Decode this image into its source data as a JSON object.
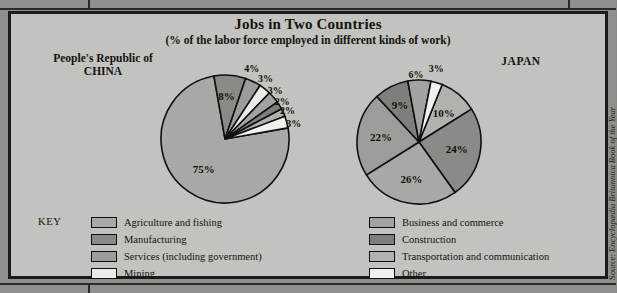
{
  "figure": {
    "title": "Jobs in Two Countries",
    "subtitle": "(% of the labor force employed in different kinds of work)",
    "source": "Source: Encyclopædia Britannica Book of the Year",
    "source_prefix": "Source: ",
    "source_italic": "Encyclopædia Britannica Book of the Year",
    "key_word": "KEY",
    "panel_bg": "#c3c3bf",
    "page_bg": "#8f8f8b",
    "ink": "#100f0e"
  },
  "legend": {
    "left_column": [
      {
        "label": "Agriculture and fishing",
        "color": "#a9a9a5",
        "swatch": "swatch-agriculture"
      },
      {
        "label": "Manufacturing",
        "color": "#8a8a86",
        "swatch": "swatch-manufacturing"
      },
      {
        "label": "Services (including government)",
        "color": "#9d9d99",
        "swatch": "swatch-services"
      },
      {
        "label": "Mining",
        "color": "#ededea",
        "swatch": "swatch-mining"
      }
    ],
    "right_column": [
      {
        "label": "Business and commerce",
        "color": "#a3a39f",
        "swatch": "swatch-business"
      },
      {
        "label": "Construction",
        "color": "#7e7e7a",
        "swatch": "swatch-construction"
      },
      {
        "label": "Transportation and communication",
        "color": "#b2b2ae",
        "swatch": "swatch-transportation"
      },
      {
        "label": "Other",
        "color": "#f2f2ef",
        "swatch": "swatch-other"
      }
    ]
  },
  "chart_data": [
    {
      "type": "pie",
      "title": "People's Republic of CHINA",
      "title_line1": "People's Republic of",
      "title_line2": "CHINA",
      "unit": "%",
      "categories": [
        "Agriculture and fishing",
        "Manufacturing",
        "Services (including government)",
        "Mining",
        "Business and commerce",
        "Construction",
        "Transportation and communication",
        "Other"
      ],
      "values": [
        75,
        8,
        4,
        3,
        3,
        2,
        2,
        3
      ],
      "labels": [
        "75%",
        "8%",
        "4%",
        "3%",
        "3%",
        "2%",
        "2%",
        "3%"
      ],
      "colors": [
        "#a9a9a5",
        "#8a8a86",
        "#9d9d99",
        "#ededea",
        "#a3a39f",
        "#7e7e7a",
        "#b2b2ae",
        "#f2f2ef"
      ],
      "start_angle_deg": -10,
      "legend_position": "bottom"
    },
    {
      "type": "pie",
      "title": "JAPAN",
      "unit": "%",
      "categories": [
        "Transportation and communication",
        "Manufacturing",
        "Agriculture and fishing",
        "Services (including government)",
        "Construction",
        "Business and commerce",
        "Other"
      ],
      "values": [
        10,
        24,
        26,
        22,
        9,
        6,
        3
      ],
      "labels": [
        "10%",
        "24%",
        "26%",
        "22%",
        "9%",
        "6%",
        "3%"
      ],
      "colors": [
        "#b2b2ae",
        "#8a8a86",
        "#a9a9a5",
        "#9d9d99",
        "#7e7e7a",
        "#a3a39f",
        "#f2f2ef"
      ],
      "start_angle_deg": -68,
      "legend_position": "bottom"
    }
  ]
}
